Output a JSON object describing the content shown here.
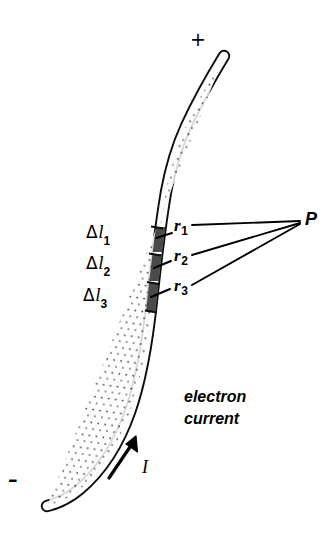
{
  "figure": {
    "kind": "physics-diagram",
    "width": 334,
    "height": 537,
    "background_color": "#ffffff",
    "ink_color": "#000000",
    "segment_fill_color": "#4a4a4a",
    "wire_interior_color": "#fbfbfb"
  },
  "terminals": {
    "positive": {
      "label": "+",
      "x": 196,
      "y": 42
    },
    "negative": {
      "label": "–",
      "x": 12,
      "y": 482
    }
  },
  "segments": [
    {
      "name": "segment-1",
      "label_delta": "Δ",
      "label_symbol": "l",
      "label_subscript": "1",
      "label_x": 88,
      "label_y": 231
    },
    {
      "name": "segment-2",
      "label_delta": "Δ",
      "label_symbol": "l",
      "label_subscript": "2",
      "label_x": 88,
      "label_y": 262
    },
    {
      "name": "segment-3",
      "label_delta": "Δ",
      "label_symbol": "l",
      "label_subscript": "3",
      "label_x": 86,
      "label_y": 294
    }
  ],
  "distances": [
    {
      "name": "distance-1",
      "label_symbol": "r",
      "label_subscript": "1",
      "label_x": 174,
      "label_y": 226
    },
    {
      "name": "distance-2",
      "label_symbol": "r",
      "label_subscript": "2",
      "label_x": 174,
      "label_y": 256
    },
    {
      "name": "distance-3",
      "label_symbol": "r",
      "label_subscript": "3",
      "label_x": 174,
      "label_y": 286
    }
  ],
  "field_point": {
    "label": "P",
    "x": 307,
    "y": 217
  },
  "current": {
    "arrow_label": "I",
    "arrow_label_x": 146,
    "arrow_label_y": 469,
    "caption_line_1": "electron",
    "caption_line_2": "current",
    "caption_x": 186,
    "caption_y": 394
  }
}
